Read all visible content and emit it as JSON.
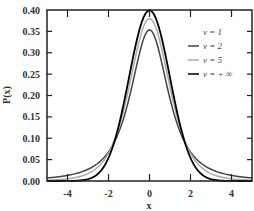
{
  "chart_data": {
    "type": "line",
    "title": "",
    "xlabel": "x",
    "ylabel": "P(x)",
    "xlim": [
      -5,
      5
    ],
    "ylim": [
      0.0,
      0.4
    ],
    "x_ticks": [
      -4,
      -2,
      0,
      2,
      4
    ],
    "x_tick_labels": [
      "-4",
      "-2",
      "0",
      "2",
      "4"
    ],
    "y_ticks": [
      0.0,
      0.05,
      0.1,
      0.15,
      0.2,
      0.25,
      0.3,
      0.35,
      0.4
    ],
    "y_tick_labels": [
      "0.00",
      "0.05",
      "0.10",
      "0.15",
      "0.20",
      "0.25",
      "0.30",
      "0.35",
      "0.40"
    ],
    "grid": false,
    "legend_position": "upper right",
    "x": [
      -5,
      -4,
      -3,
      -2,
      -1,
      0,
      1,
      2,
      3,
      4,
      5
    ],
    "series": [
      {
        "name": "ν = 1",
        "label_prefix": "ν",
        "label_value": "= 1",
        "nu": 1,
        "color": "#ffffff",
        "values": [
          0.012,
          0.019,
          0.032,
          0.064,
          0.159,
          0.318,
          0.159,
          0.064,
          0.032,
          0.019,
          0.012
        ]
      },
      {
        "name": "ν = 2",
        "label_prefix": "ν",
        "label_value": "= 2",
        "nu": 2,
        "color": "#444444",
        "values": [
          0.007,
          0.013,
          0.027,
          0.068,
          0.192,
          0.354,
          0.192,
          0.068,
          0.027,
          0.013,
          0.007
        ]
      },
      {
        "name": "ν = 5",
        "label_prefix": "ν",
        "label_value": "= 5",
        "nu": 5,
        "color": "#aaaaaa",
        "values": [
          0.002,
          0.005,
          0.017,
          0.065,
          0.22,
          0.38,
          0.22,
          0.065,
          0.017,
          0.005,
          0.002
        ]
      },
      {
        "name": "ν = + ∞",
        "label_prefix": "ν",
        "label_value": "= + ∞",
        "nu": "inf",
        "color": "#000000",
        "values": [
          0.0,
          0.0,
          0.004,
          0.054,
          0.242,
          0.399,
          0.242,
          0.054,
          0.004,
          0.0,
          0.0
        ]
      }
    ]
  }
}
